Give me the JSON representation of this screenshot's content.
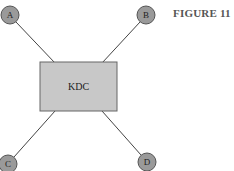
{
  "figure": {
    "label": "FIGURE 11"
  },
  "colors": {
    "node_fill": "#9a9a9a",
    "node_stroke": "#555555",
    "box_fill": "#c8c8c8",
    "box_stroke": "#666666",
    "line": "#444444"
  },
  "center": {
    "label": "KDC"
  },
  "nodes": [
    {
      "id": "A",
      "label": "A"
    },
    {
      "id": "B",
      "label": "B"
    },
    {
      "id": "C",
      "label": "C"
    },
    {
      "id": "D",
      "label": "D"
    }
  ]
}
